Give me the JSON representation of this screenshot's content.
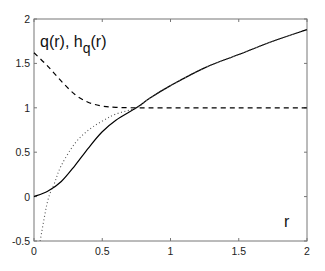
{
  "chart_data": {
    "type": "line",
    "title": "",
    "xlabel": "r",
    "ylabel": "q(r), h_q(r)",
    "xlim": [
      0,
      2
    ],
    "ylim": [
      -0.5,
      2
    ],
    "x_ticks": [
      0,
      0.5,
      1,
      1.5,
      2
    ],
    "x_tick_labels": [
      "0",
      "0.5",
      "1",
      "1.5",
      "2"
    ],
    "y_ticks": [
      -0.5,
      0,
      0.5,
      1,
      1.5,
      2
    ],
    "y_tick_labels": [
      "-0.5",
      "0",
      "0.5",
      "1",
      "1.5",
      "2"
    ],
    "grid": false,
    "legend": null,
    "annotations": [
      {
        "text": "q(r), h",
        "sub": "q",
        "suffix": "(r)",
        "position": "upper-left"
      },
      {
        "text": "r",
        "position": "lower-right"
      }
    ],
    "series": [
      {
        "name": "q(r)",
        "style": "solid",
        "color": "#000000",
        "x": [
          0,
          0.1,
          0.2,
          0.3,
          0.4,
          0.5,
          0.6,
          0.75,
          0.85,
          1.0,
          1.25,
          1.5,
          1.75,
          2.0
        ],
        "values": [
          0,
          0.06,
          0.17,
          0.35,
          0.55,
          0.73,
          0.86,
          1.0,
          1.11,
          1.25,
          1.45,
          1.6,
          1.75,
          1.88
        ]
      },
      {
        "name": "h_q(r)",
        "style": "dotted",
        "color": "#555555",
        "x": [
          0.045,
          0.1,
          0.15,
          0.2,
          0.3,
          0.4,
          0.5,
          0.6,
          0.75,
          0.85,
          1.0,
          1.25,
          1.5,
          1.75,
          2.0
        ],
        "values": [
          -0.5,
          -0.05,
          0.15,
          0.35,
          0.6,
          0.75,
          0.85,
          0.93,
          1.0,
          1.11,
          1.25,
          1.45,
          1.6,
          1.75,
          1.88
        ]
      },
      {
        "name": "asymptote",
        "style": "dashed",
        "color": "#000000",
        "x": [
          0,
          0.1,
          0.2,
          0.3,
          0.4,
          0.5,
          0.6,
          0.75,
          1.0,
          1.5,
          2.0
        ],
        "values": [
          1.62,
          1.47,
          1.3,
          1.15,
          1.06,
          1.02,
          1.005,
          1.0,
          1.0,
          1.0,
          1.0
        ]
      }
    ]
  },
  "labels": {
    "ylabel_main": "q(r), h",
    "ylabel_sub": "q",
    "ylabel_suffix": "(r)",
    "xlabel": "r"
  }
}
